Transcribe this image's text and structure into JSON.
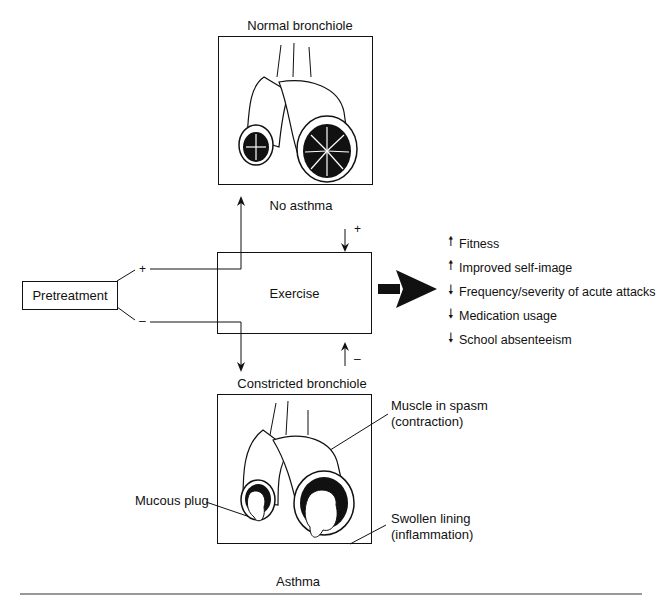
{
  "diagram": {
    "top_panel": {
      "title": "Normal bronchiole",
      "caption": "No asthma"
    },
    "bottom_panel": {
      "title": "Constricted bronchiole",
      "caption": "Asthma",
      "annotations": {
        "muscle": [
          "Muscle in spasm",
          "(contraction)"
        ],
        "mucous": "Mucous plug",
        "swollen": [
          "Swollen lining",
          "(inflammation)"
        ]
      }
    },
    "pretreatment": {
      "label": "Pretreatment",
      "plus": "+",
      "minus": "–"
    },
    "exercise": {
      "label": "Exercise",
      "plus": "+",
      "minus": "–"
    },
    "outcomes": [
      {
        "direction": "up",
        "label": "Fitness"
      },
      {
        "direction": "up",
        "label": "Improved self-image"
      },
      {
        "direction": "down",
        "label": "Frequency/severity of acute attacks"
      },
      {
        "direction": "down",
        "label": "Medication usage"
      },
      {
        "direction": "down",
        "label": "School absenteeism"
      }
    ]
  }
}
